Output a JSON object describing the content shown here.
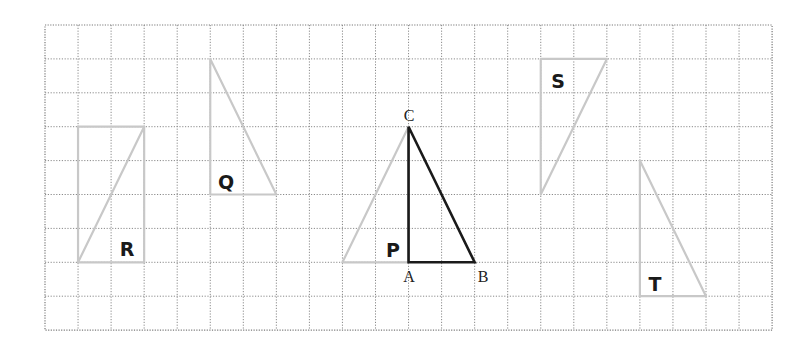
{
  "grid": {
    "origin_x": 45,
    "origin_y": 25,
    "cell_w": 33.05,
    "cell_h": 33.9,
    "cols": 22,
    "rows": 9,
    "line_color": "#8a8a8a"
  },
  "colors": {
    "original": "#1a1a1a",
    "images": "#c8c8c8"
  },
  "original_triangle": {
    "name": "ABC",
    "vertices": {
      "A": {
        "col": 11,
        "row": 7,
        "label": "A"
      },
      "B": {
        "col": 13,
        "row": 7,
        "label": "B"
      },
      "C": {
        "col": 11,
        "row": 3,
        "label": "C"
      }
    }
  },
  "image_shapes": [
    {
      "label": "P",
      "points": [
        [
          9,
          7
        ],
        [
          11,
          7
        ],
        [
          11,
          3
        ]
      ],
      "label_pos": [
        393,
        257
      ]
    },
    {
      "label": "Q",
      "points": [
        [
          5,
          1
        ],
        [
          5,
          5
        ],
        [
          7,
          5
        ]
      ],
      "label_pos": [
        226,
        189
      ]
    },
    {
      "label": "R",
      "points": [
        [
          1,
          7
        ],
        [
          3,
          7
        ],
        [
          3,
          3
        ]
      ],
      "extra_edges": [
        [
          [
            1,
            7
          ],
          [
            1,
            3
          ]
        ],
        [
          [
            1,
            3
          ],
          [
            3,
            3
          ]
        ]
      ],
      "label_pos": [
        127,
        256
      ]
    },
    {
      "label": "S",
      "points": [
        [
          15,
          1
        ],
        [
          17,
          1
        ],
        [
          15,
          5
        ]
      ],
      "label_pos": [
        558,
        88
      ]
    },
    {
      "label": "T",
      "points": [
        [
          18,
          4
        ],
        [
          18,
          8
        ],
        [
          20,
          8
        ]
      ],
      "label_pos": [
        655,
        291
      ]
    }
  ],
  "labels": {
    "P": "P",
    "Q": "Q",
    "R": "R",
    "S": "S",
    "T": "T",
    "A": "A",
    "B": "B",
    "C": "C"
  }
}
